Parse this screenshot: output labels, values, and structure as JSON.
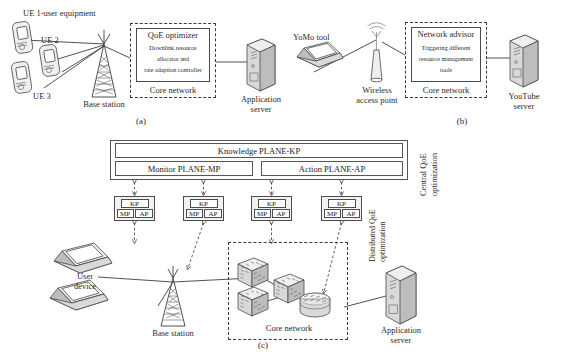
{
  "figure": {
    "panels": [
      {
        "id": "a",
        "caption": "(a)",
        "labels": {
          "ue1": "UE 1-user equipment",
          "ue2": "UE 2",
          "ue3": "UE 3",
          "base_station": "Base station",
          "core_network": "Core network",
          "application_server_l1": "Application",
          "application_server_l2": "server"
        },
        "box": {
          "title": "QoE optimizer",
          "line1": "Downlink resource",
          "line2": "allocator and",
          "line3": "rate adaption controller"
        },
        "icons": {
          "phone": "mobile-phone-icon",
          "tower": "cell-tower-icon",
          "server": "server-tower-icon"
        }
      },
      {
        "id": "b",
        "caption": "(b)",
        "labels": {
          "yomo_tool": "YoMo tool",
          "wireless_ap_l1": "Wireless",
          "wireless_ap_l2": "access point",
          "core_network": "Core network",
          "youtube_server_l1": "YouTube",
          "youtube_server_l2": "server"
        },
        "box": {
          "title": "Network advisor",
          "line1": "Triggering different",
          "line2": "resource management",
          "line3": "tools"
        },
        "icons": {
          "laptop": "laptop-icon",
          "access_point": "wireless-access-point-icon",
          "server": "server-tower-icon"
        }
      },
      {
        "id": "c",
        "caption": "(c)",
        "planes": {
          "knowledge": "Knowledge PLANE-KP",
          "monitor": "Monitor PLANE-MP",
          "action": "Action PLANE-AP"
        },
        "agent_box": {
          "kp": "KP",
          "mp": "MP",
          "ap": "AP"
        },
        "agent_count": 4,
        "vertical_labels": {
          "central_l1": "Central QoE",
          "central_l2": "optimization",
          "distributed_l1": "Distributed QoE",
          "distributed_l2": "optimization"
        },
        "labels": {
          "user_device_l1": "User",
          "user_device_l2": "device",
          "base_station": "Base station",
          "core_network": "Core network",
          "application_server_l1": "Application",
          "application_server_l2": "server"
        },
        "icons": {
          "laptop": "laptop-icon",
          "tower": "cell-tower-icon",
          "router": "router-cube-icon",
          "router_cyl": "router-cylinder-icon",
          "server": "server-tower-icon"
        }
      }
    ]
  },
  "colors": {
    "stroke": "#3d3d3d",
    "fill_light": "#efefef",
    "fill_mid": "#d9d9d9",
    "fill_dark": "#bdbdbd",
    "background": "#ffffff",
    "text": "#2a2a2a"
  }
}
